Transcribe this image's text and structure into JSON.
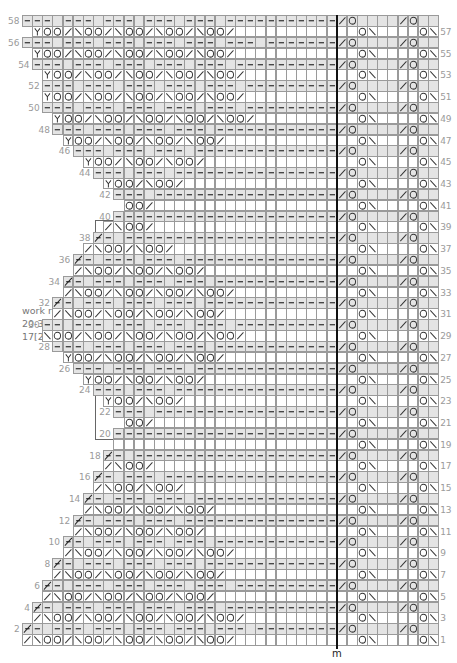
{
  "chart_data": {
    "type": "knitting-chart",
    "total_columns": 41,
    "left_columns": 31,
    "right_columns": 10,
    "marker_label": "m",
    "annotation": {
      "lines": [
        "work rows",
        "20-39 a total of",
        "17[26] times"
      ],
      "bracket_rows": [
        20,
        40
      ]
    },
    "legend_symbols": {
      "-": "dash (purl)",
      "O": "yarn over",
      "/": "right-slanting decrease",
      "\\": "left-slanting decrease",
      "Y": "Y stitch",
      "x": "bind-off slash",
      ".": "blank / knit"
    },
    "right_pattern": {
      "odd": "..O\\....O\\/O",
      "even": "/O..../O....",
      "odd_gray": "0000000000",
      "even_gray": "1111111111"
    },
    "rows": [
      {
        "n": 1,
        "start": 0,
        "left": "/\\OO/\\OO/\\OO/\\OO/\\OO/"
      },
      {
        "n": 2,
        "start": 0,
        "left": "x-.---.---.---.---.---.---------",
        "even": true
      },
      {
        "n": 3,
        "start": 1,
        "left": "/\\OO/\\OO/\\OO/\\OO/\\OO/"
      },
      {
        "n": 4,
        "start": 1,
        "left": "x-.---.---.---.---.-----------",
        "even": true
      },
      {
        "n": 5,
        "start": 2,
        "left": "/\\OO/\\OO/\\OO/\\OO/"
      },
      {
        "n": 6,
        "start": 2,
        "left": "x-.---.---.---.---.---------",
        "even": true
      },
      {
        "n": 7,
        "start": 3,
        "left": "/\\OO/\\OO/\\OO/\\OO/"
      },
      {
        "n": 8,
        "start": 3,
        "left": "x-.---.---.---.-----------",
        "even": true
      },
      {
        "n": 9,
        "start": 4,
        "left": "/\\OO/\\OO/\\OO/\\OO/"
      },
      {
        "n": 10,
        "start": 4,
        "left": "x-.---.---.---.---------",
        "even": true
      },
      {
        "n": 11,
        "start": 5,
        "left": "/\\OO/\\OO/\\OO/"
      },
      {
        "n": 12,
        "start": 5,
        "left": "x-.---.---.-----------",
        "even": true
      },
      {
        "n": 13,
        "start": 6,
        "left": "/\\OO/\\OO/\\OO/"
      },
      {
        "n": 14,
        "start": 6,
        "left": "x-.---.---.---------",
        "even": true
      },
      {
        "n": 15,
        "start": 7,
        "left": "/\\OO/\\OO/"
      },
      {
        "n": 16,
        "start": 7,
        "left": "x-.---.-----------",
        "even": true
      },
      {
        "n": 17,
        "start": 8,
        "left": "/\\OO/"
      },
      {
        "n": 18,
        "start": 8,
        "left": "x-.-----------",
        "even": true
      },
      {
        "n": 19,
        "start": 9,
        "left": ""
      },
      {
        "n": 20,
        "start": 9,
        "left": "-------------",
        "even": true
      },
      {
        "n": 21,
        "start": 10,
        "left": "OO/"
      },
      {
        "n": 22,
        "start": 9,
        "left": "---.---------",
        "even": true
      },
      {
        "n": 23,
        "start": 8,
        "left": "YOO/\\OO/"
      },
      {
        "n": 24,
        "start": 7,
        "left": "---.---.---------",
        "even": true
      },
      {
        "n": 25,
        "start": 6,
        "left": "YOO/\\OO/\\OO/"
      },
      {
        "n": 26,
        "start": 5,
        "left": "---.---.---.---------",
        "even": true
      },
      {
        "n": 27,
        "start": 4,
        "left": "YOO/\\OO/\\OO/\\OO/"
      },
      {
        "n": 28,
        "start": 3,
        "left": "---.---.---.---.---------",
        "even": true
      },
      {
        "n": 29,
        "start": 2,
        "left": "\\OO/\\OO/\\OO/\\OO/\\OO/"
      },
      {
        "n": 30,
        "start": 2,
        "left": "--.---.---.---.---.---------",
        "even": true
      },
      {
        "n": 31,
        "start": 3,
        "left": "/\\OO/\\OO/\\OO/\\OO/"
      },
      {
        "n": 32,
        "start": 3,
        "left": "x-.---.---.---.-----------",
        "even": true
      },
      {
        "n": 33,
        "start": 4,
        "left": "/\\OO/\\OO/\\OO/\\OO/"
      },
      {
        "n": 34,
        "start": 4,
        "left": "x-.---.---.---.---------",
        "even": true
      },
      {
        "n": 35,
        "start": 5,
        "left": "/\\OO/\\OO/\\OO/"
      },
      {
        "n": 36,
        "start": 5,
        "left": "x-.---.---.-----------",
        "even": true
      },
      {
        "n": 37,
        "start": 6,
        "left": "/\\OO/\\OO/"
      },
      {
        "n": 38,
        "start": 7,
        "left": "x-.-----------",
        "even": true
      },
      {
        "n": 39,
        "start": 8,
        "left": "/\\OO/"
      },
      {
        "n": 40,
        "start": 9,
        "left": "-------------",
        "even": true
      },
      {
        "n": 41,
        "start": 10,
        "left": "OO/"
      },
      {
        "n": 42,
        "start": 9,
        "left": "---.---------",
        "even": true
      },
      {
        "n": 43,
        "start": 8,
        "left": "YOO/\\OO/"
      },
      {
        "n": 44,
        "start": 7,
        "left": "---.---.---------",
        "even": true
      },
      {
        "n": 45,
        "start": 6,
        "left": "YOO/\\OO/\\OO/"
      },
      {
        "n": 46,
        "start": 5,
        "left": "---.---.---.---------",
        "even": true
      },
      {
        "n": 47,
        "start": 4,
        "left": "YOO/\\OO/\\OO/\\OO/"
      },
      {
        "n": 48,
        "start": 3,
        "left": "---.---.---.---.---------",
        "even": true
      },
      {
        "n": 49,
        "start": 3,
        "left": "YOO/\\OO/\\OO/\\OO/\\OO/"
      },
      {
        "n": 50,
        "start": 2,
        "left": "---.---.---.---.---.---------",
        "even": true
      },
      {
        "n": 51,
        "start": 2,
        "left": "YOO/\\OO/\\OO/\\OO/\\OO/"
      },
      {
        "n": 52,
        "start": 2,
        "left": "---.---.---.---.---.---------",
        "even": true
      },
      {
        "n": 53,
        "start": 2,
        "left": "YOO/\\OO/\\OO/\\OO/\\OO/"
      },
      {
        "n": 54,
        "start": 1,
        "left": "---.---.---.---.---.-----------",
        "even": true
      },
      {
        "n": 55,
        "start": 1,
        "left": "YOO/\\OO/\\OO/\\OO/\\OO/"
      },
      {
        "n": 56,
        "start": 0,
        "left": "---.---.---.---.---.---.-------",
        "even": true
      },
      {
        "n": 57,
        "start": 1,
        "left": "YOO/\\OO/\\OO/\\OO/\\OO/"
      },
      {
        "n": 58,
        "start": 0,
        "left": "---.---.---.---.---.----------",
        "even": true
      }
    ]
  },
  "labels": {
    "marker": "m",
    "note_line1": "work rows",
    "note_line2": "20-39 a total of",
    "note_line3": "17[26] times"
  }
}
